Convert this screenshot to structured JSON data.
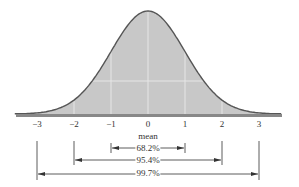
{
  "chart_data": {
    "type": "area",
    "title": "",
    "xlabel": "mean",
    "ylabel": "",
    "x_ticks": [
      "-3",
      "-2",
      "-1",
      "0",
      "1",
      "2",
      "3"
    ],
    "x_range": [
      -3.6,
      3.6
    ],
    "grid": true,
    "series": [
      {
        "name": "standard normal density",
        "distribution": "normal",
        "mean": 0,
        "sd": 1,
        "fill": "#c8c8c8",
        "stroke": "#555555"
      }
    ],
    "annotations": [
      {
        "label": "68.2%",
        "from": -1,
        "to": 1
      },
      {
        "label": "95.4%",
        "from": -2,
        "to": 2
      },
      {
        "label": "99.7%",
        "from": -3,
        "to": 3
      }
    ]
  },
  "labels": {
    "ticks": [
      "−3",
      "−2",
      "−1",
      "0",
      "1",
      "2",
      "3"
    ],
    "mean": "mean",
    "p1": "68.2%",
    "p2": "95.4%",
    "p3": "99.7%"
  },
  "colors": {
    "fill": "#c8c8c8",
    "stroke": "#555555",
    "grid": "#e6e6e6",
    "axis": "#777777"
  }
}
